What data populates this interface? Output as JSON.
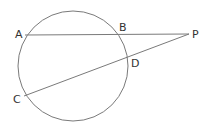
{
  "diagram": {
    "title": "",
    "stroke_color": "#7a7a7a",
    "label_color": "#333333",
    "circle": {
      "cx": 73,
      "cy": 66,
      "r": 55
    },
    "points": {
      "A": {
        "label": "A",
        "x": 25,
        "y": 35,
        "label_x": 15,
        "label_y": 38
      },
      "B": {
        "label": "B",
        "x": 119,
        "y": 35,
        "label_x": 119,
        "label_y": 31
      },
      "C": {
        "label": "C",
        "x": 24,
        "y": 96,
        "label_x": 13,
        "label_y": 103
      },
      "D": {
        "label": "D",
        "x": 128,
        "y": 58,
        "label_x": 131,
        "label_y": 67
      },
      "P": {
        "label": "P",
        "x": 189,
        "y": 34,
        "label_x": 192,
        "label_y": 38
      }
    },
    "segments": [
      {
        "from": "A",
        "to": "P"
      },
      {
        "from": "C",
        "to": "P"
      }
    ]
  }
}
